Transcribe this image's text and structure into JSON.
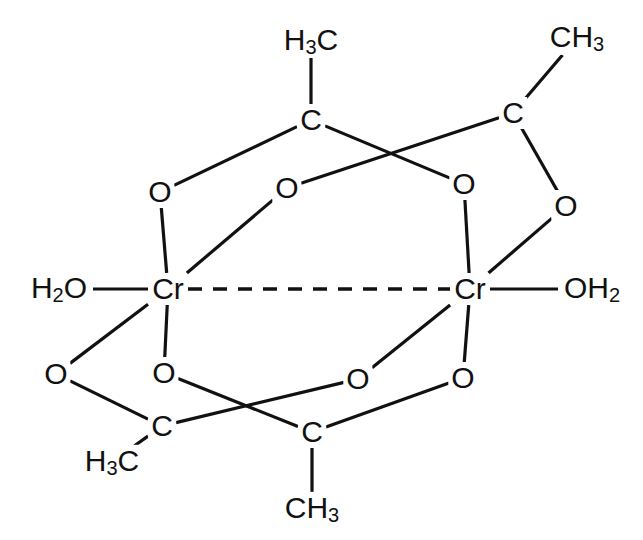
{
  "figure": {
    "background_color": "#ffffff",
    "stroke_color": "#111111"
  },
  "chart_data": {
    "type": "diagram",
    "subtype": "chemical-structure",
    "atoms": [
      {
        "id": "ch3_top_left",
        "label": "H₃C",
        "x": 311,
        "y": 41,
        "kind": "methyl"
      },
      {
        "id": "ch3_top_right",
        "label": "CH₃",
        "x": 577,
        "y": 38,
        "kind": "methyl"
      },
      {
        "id": "ch3_bot_left",
        "label": "H₃C",
        "x": 112,
        "y": 462,
        "kind": "methyl"
      },
      {
        "id": "ch3_bot_right",
        "label": "CH₃",
        "x": 312,
        "y": 509,
        "kind": "methyl"
      },
      {
        "id": "c_top_left",
        "label": "C",
        "x": 311,
        "y": 120,
        "kind": "carbon"
      },
      {
        "id": "c_top_right",
        "label": "C",
        "x": 513,
        "y": 113,
        "kind": "carbon"
      },
      {
        "id": "c_bot_left",
        "label": "C",
        "x": 162,
        "y": 426,
        "kind": "carbon"
      },
      {
        "id": "c_bot_right",
        "label": "C",
        "x": 312,
        "y": 432,
        "kind": "carbon"
      },
      {
        "id": "o_top_left",
        "label": "O",
        "x": 160,
        "y": 192,
        "kind": "oxygen"
      },
      {
        "id": "o_top_mid",
        "label": "O",
        "x": 287,
        "y": 188,
        "kind": "oxygen"
      },
      {
        "id": "o_top_right",
        "label": "O",
        "x": 464,
        "y": 184,
        "kind": "oxygen"
      },
      {
        "id": "o_far_right",
        "label": "O",
        "x": 566,
        "y": 206,
        "kind": "oxygen"
      },
      {
        "id": "o_bot_far_left",
        "label": "O",
        "x": 56,
        "y": 374,
        "kind": "oxygen"
      },
      {
        "id": "o_bot_left",
        "label": "O",
        "x": 164,
        "y": 373,
        "kind": "oxygen"
      },
      {
        "id": "o_bot_mid",
        "label": "O",
        "x": 358,
        "y": 379,
        "kind": "oxygen"
      },
      {
        "id": "o_bot_right",
        "label": "O",
        "x": 463,
        "y": 378,
        "kind": "oxygen"
      },
      {
        "id": "cr_left",
        "label": "Cr",
        "x": 168,
        "y": 289,
        "kind": "metal"
      },
      {
        "id": "cr_right",
        "label": "Cr",
        "x": 470,
        "y": 289,
        "kind": "metal"
      },
      {
        "id": "h2o_left",
        "label": "H₂O",
        "x": 59,
        "y": 289,
        "kind": "aqua"
      },
      {
        "id": "oh2_right",
        "label": "OH₂",
        "x": 592,
        "y": 289,
        "kind": "aqua"
      }
    ],
    "bonds": [
      {
        "from": "ch3_top_left",
        "to": "c_top_left",
        "style": "solid"
      },
      {
        "from": "c_top_left",
        "to": "o_top_left",
        "style": "solid"
      },
      {
        "from": "c_top_left",
        "to": "o_top_right",
        "style": "solid"
      },
      {
        "from": "ch3_top_right",
        "to": "c_top_right",
        "style": "solid"
      },
      {
        "from": "c_top_right",
        "to": "o_top_mid",
        "style": "solid"
      },
      {
        "from": "c_top_right",
        "to": "o_far_right",
        "style": "solid"
      },
      {
        "from": "o_top_left",
        "to": "cr_left",
        "style": "solid"
      },
      {
        "from": "o_top_mid",
        "to": "cr_left",
        "style": "solid"
      },
      {
        "from": "o_top_right",
        "to": "cr_right",
        "style": "solid"
      },
      {
        "from": "o_far_right",
        "to": "cr_right",
        "style": "solid"
      },
      {
        "from": "h2o_left",
        "to": "cr_left",
        "style": "solid"
      },
      {
        "from": "cr_right",
        "to": "oh2_right",
        "style": "solid"
      },
      {
        "from": "cr_left",
        "to": "cr_right",
        "style": "dashed"
      },
      {
        "from": "cr_left",
        "to": "o_bot_far_left",
        "style": "solid"
      },
      {
        "from": "cr_left",
        "to": "o_bot_left",
        "style": "solid"
      },
      {
        "from": "cr_right",
        "to": "o_bot_mid",
        "style": "solid"
      },
      {
        "from": "cr_right",
        "to": "o_bot_right",
        "style": "solid"
      },
      {
        "from": "o_bot_far_left",
        "to": "c_bot_left",
        "style": "solid"
      },
      {
        "from": "o_bot_left",
        "to": "c_bot_right",
        "style": "solid"
      },
      {
        "from": "o_bot_mid",
        "to": "c_bot_left",
        "style": "solid"
      },
      {
        "from": "o_bot_right",
        "to": "c_bot_right",
        "style": "solid"
      },
      {
        "from": "c_bot_left",
        "to": "ch3_bot_left",
        "style": "solid"
      },
      {
        "from": "c_bot_right",
        "to": "ch3_bot_right",
        "style": "solid"
      }
    ]
  }
}
